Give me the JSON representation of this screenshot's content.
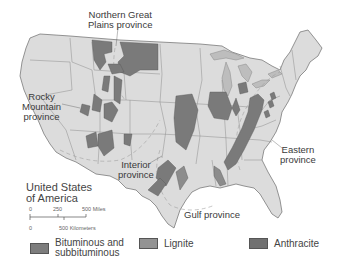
{
  "map": {
    "title_line1": "United States",
    "title_line2": "of America",
    "labels": {
      "northern_great_plains": [
        "Northern Great",
        "Plains province"
      ],
      "rocky_mountain": [
        "Rocky",
        "Mountain",
        "province"
      ],
      "interior": [
        "Interior",
        "province"
      ],
      "eastern": [
        "Eastern",
        "province"
      ],
      "gulf": "Gulf province"
    },
    "scale": {
      "miles_ticks": [
        "0",
        "250",
        "500 Miles"
      ],
      "km_ticks": [
        "0",
        "500 Kilometers"
      ]
    },
    "colors": {
      "land": "#dcdcdc",
      "coal": "#7a7a7a",
      "lignite": "#9a9a9a",
      "lakes": "#b8b8b8",
      "borders": "#8c8c8c",
      "ocean": "#ffffff"
    }
  },
  "legend": {
    "items": [
      {
        "label_line1": "Bituminous and",
        "label_line2": "subbituminous",
        "color": "#7d7d7d"
      },
      {
        "label_line1": "Lignite",
        "label_line2": "",
        "color": "#939393"
      },
      {
        "label_line1": "Anthracite",
        "label_line2": "",
        "color": "#717171"
      }
    ]
  }
}
